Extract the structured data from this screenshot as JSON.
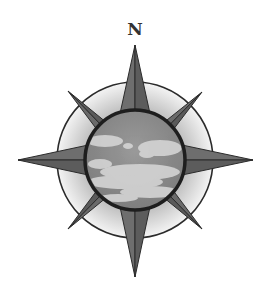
{
  "diagram": {
    "type": "compass-rose",
    "north_label": "N",
    "points": 8,
    "colors": {
      "background": "#ffffff",
      "point_fill": "#6e6e6e",
      "point_stroke": "#2b2b2b",
      "ring_fill_light": "#f2f2f2",
      "ring_fill_dark": "#b8b8b8",
      "ring_stroke": "#2b2b2b",
      "sky_fill": "#8c8c8c",
      "cloud_fill": "#d9d9d9",
      "sky_border": "#1e1e1e"
    },
    "center_image": "cloudy-sky"
  }
}
